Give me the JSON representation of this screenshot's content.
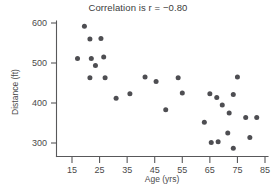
{
  "chart_data": {
    "type": "scatter",
    "title": "Correlation is r = −0.80",
    "xlabel": "Age (yrs)",
    "ylabel": "Distance (ft)",
    "xlim": [
      10,
      88
    ],
    "ylim": [
      270,
      615
    ],
    "xticks": [
      15,
      25,
      35,
      45,
      55,
      65,
      75,
      85
    ],
    "yticks": [
      300,
      400,
      500,
      600
    ],
    "xtick_labels": [
      "15",
      "25",
      "35",
      "45",
      "55",
      "65",
      "75",
      "85"
    ],
    "ytick_labels": [
      "300",
      "400",
      "500",
      "600"
    ],
    "grid": false,
    "legend": false,
    "correlation": -0.8,
    "marker_color": "#4e4e52",
    "axis_color": "#58585a",
    "text_color": "#4a4a4a",
    "background": "#ffffff",
    "series": [
      {
        "name": "drivers",
        "points": [
          [
            19.5,
            592
          ],
          [
            21.5,
            560
          ],
          [
            25.5,
            561
          ],
          [
            17.0,
            511
          ],
          [
            22.0,
            511
          ],
          [
            26.5,
            515
          ],
          [
            23.5,
            494
          ],
          [
            21.5,
            463
          ],
          [
            27.0,
            463
          ],
          [
            31.0,
            412
          ],
          [
            36.0,
            423
          ],
          [
            41.5,
            465
          ],
          [
            45.5,
            454
          ],
          [
            49.0,
            383
          ],
          [
            53.5,
            463
          ],
          [
            55.0,
            425
          ],
          [
            63.0,
            352
          ],
          [
            65.0,
            423
          ],
          [
            65.5,
            301
          ],
          [
            67.5,
            414
          ],
          [
            68.0,
            303
          ],
          [
            69.5,
            395
          ],
          [
            71.5,
            325
          ],
          [
            72.0,
            375
          ],
          [
            73.5,
            421
          ],
          [
            73.5,
            287
          ],
          [
            75.0,
            465
          ],
          [
            78.0,
            364
          ],
          [
            79.5,
            314
          ],
          [
            82.0,
            364
          ]
        ]
      }
    ]
  }
}
